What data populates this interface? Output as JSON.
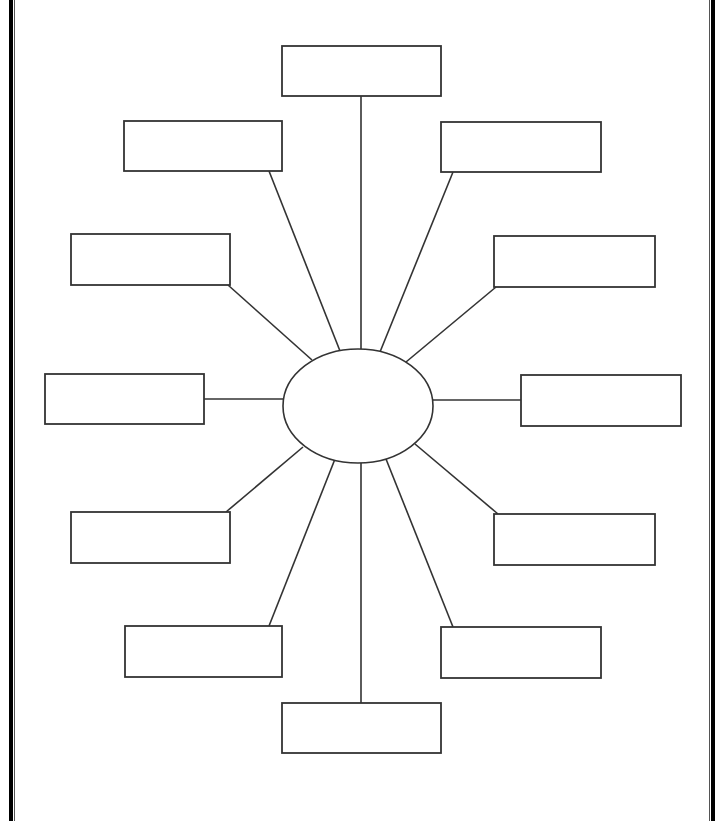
{
  "diagram": {
    "type": "spider-map graphic organizer",
    "stroke_color": "#333333",
    "border_color": "#000000",
    "center": {
      "label": "",
      "cx": 358,
      "cy": 406,
      "rx": 75,
      "ry": 57
    },
    "boxes": [
      {
        "id": "top",
        "label": "",
        "x": 282,
        "y": 46,
        "w": 159,
        "h": 50,
        "line": [
          361,
          96,
          361,
          349
        ]
      },
      {
        "id": "upper-left",
        "label": "",
        "x": 124,
        "y": 121,
        "w": 158,
        "h": 50,
        "line": [
          269,
          171,
          340,
          351
        ]
      },
      {
        "id": "upper-right",
        "label": "",
        "x": 441,
        "y": 122,
        "w": 160,
        "h": 50,
        "line": [
          453,
          172,
          380,
          352
        ]
      },
      {
        "id": "mid-upper-left",
        "label": "",
        "x": 71,
        "y": 234,
        "w": 159,
        "h": 51,
        "line": [
          228,
          285,
          312,
          360
        ]
      },
      {
        "id": "mid-upper-right",
        "label": "",
        "x": 494,
        "y": 236,
        "w": 161,
        "h": 51,
        "line": [
          496,
          287,
          406,
          362
        ]
      },
      {
        "id": "left",
        "label": "",
        "x": 45,
        "y": 374,
        "w": 159,
        "h": 50,
        "line": [
          204,
          399,
          283,
          399
        ]
      },
      {
        "id": "right",
        "label": "",
        "x": 521,
        "y": 375,
        "w": 160,
        "h": 51,
        "line": [
          432,
          400,
          521,
          400
        ]
      },
      {
        "id": "mid-lower-left",
        "label": "",
        "x": 71,
        "y": 512,
        "w": 159,
        "h": 51,
        "line": [
          226,
          512,
          303,
          447
        ]
      },
      {
        "id": "mid-lower-right",
        "label": "",
        "x": 494,
        "y": 514,
        "w": 161,
        "h": 51,
        "line": [
          498,
          514,
          415,
          444
        ]
      },
      {
        "id": "lower-left",
        "label": "",
        "x": 125,
        "y": 626,
        "w": 157,
        "h": 51,
        "line": [
          269,
          626,
          335,
          459
        ]
      },
      {
        "id": "lower-right",
        "label": "",
        "x": 441,
        "y": 627,
        "w": 160,
        "h": 51,
        "line": [
          453,
          627,
          386,
          459
        ]
      },
      {
        "id": "bottom",
        "label": "",
        "x": 282,
        "y": 703,
        "w": 159,
        "h": 50,
        "line": [
          361,
          463,
          361,
          703
        ]
      }
    ]
  }
}
